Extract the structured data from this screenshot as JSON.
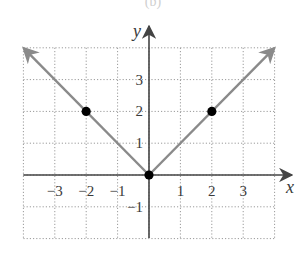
{
  "caption": "(b)",
  "chart_data": {
    "type": "line",
    "title": "",
    "function": "y = |x|",
    "xlabel": "x",
    "ylabel": "y",
    "xlim": [
      -4,
      4
    ],
    "ylim": [
      -2,
      4
    ],
    "grid": true,
    "grid_style": "dotted",
    "x_ticks": [
      -3,
      -2,
      -1,
      1,
      2,
      3
    ],
    "y_ticks": [
      -1,
      1,
      2,
      3
    ],
    "x_tick_labels": [
      "−3",
      "−2",
      "−1",
      "1",
      "2",
      "3"
    ],
    "y_tick_labels": [
      "−1",
      "1",
      "2",
      "3"
    ],
    "series": [
      {
        "name": "y = |x|",
        "x": [
          -4,
          0,
          4
        ],
        "y": [
          4,
          0,
          4
        ],
        "color": "#8a8a8a",
        "arrows_at_ends": true
      }
    ],
    "points": [
      {
        "x": -2,
        "y": 2
      },
      {
        "x": 0,
        "y": 0
      },
      {
        "x": 2,
        "y": 2
      }
    ],
    "point_color": "#000000",
    "axis_color": "#444444",
    "grid_color": "#9a9a9a"
  }
}
